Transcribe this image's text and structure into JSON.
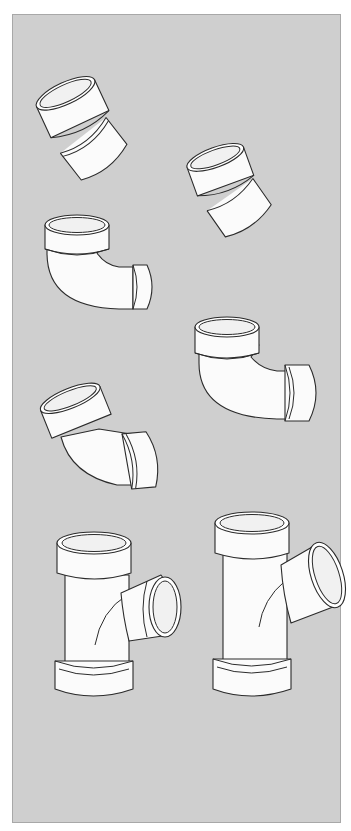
{
  "illustration": {
    "subject": "PVC DWV pipe fittings",
    "background_color": "#cfcfcf",
    "border_color": "#a8a8a8",
    "fitting_color": "#fbfbfb",
    "outline_color": "#2b2b2b",
    "fittings": [
      {
        "id": "bend-22-5-a",
        "type": "22.5-degree bend",
        "position": "top-left"
      },
      {
        "id": "bend-22-5-b",
        "type": "22.5-degree bend",
        "position": "top-right"
      },
      {
        "id": "elbow-90-a",
        "type": "90-degree elbow",
        "position": "middle-left"
      },
      {
        "id": "elbow-90-b",
        "type": "90-degree elbow",
        "position": "middle-right"
      },
      {
        "id": "elbow-45",
        "type": "45-degree elbow",
        "position": "lower-left"
      },
      {
        "id": "sanitary-tee",
        "type": "sanitary tee",
        "position": "bottom-left"
      },
      {
        "id": "wye",
        "type": "wye",
        "position": "bottom-right"
      }
    ]
  }
}
